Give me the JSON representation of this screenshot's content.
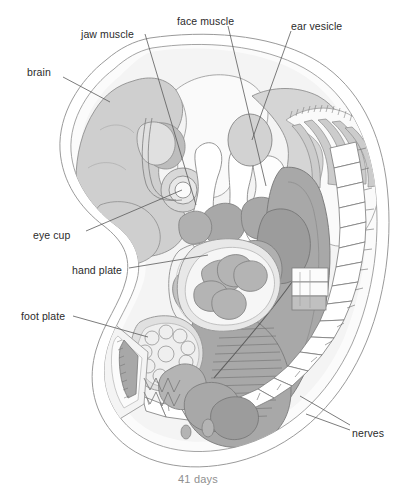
{
  "figure": {
    "caption": "41 days",
    "background_color": "#ffffff",
    "outline_color": "#9a9a9a",
    "line_color": "#6d6d6d",
    "label_color": "#2b2b2b",
    "caption_color": "#8f8f8f",
    "fills": {
      "amnion": "#ffffff",
      "body_pale": "#f2f2f2",
      "tissue_light": "#e2e2e2",
      "tissue_mid": "#cfcfcf",
      "tissue_dark": "#b4b4b4",
      "organ_dark": "#a8a8a8",
      "organ_darkest": "#9c9c9c"
    }
  },
  "labels": [
    {
      "id": "brain",
      "text": "brain",
      "x": 27,
      "y": 66,
      "leader": "M 63,77 L 110,102"
    },
    {
      "id": "jaw-muscle",
      "text": "jaw muscle",
      "x": 81,
      "y": 28,
      "leader": "M 145,34 L 196,205"
    },
    {
      "id": "face-muscle",
      "text": "face muscle",
      "x": 177,
      "y": 15,
      "leader": "M 228,26 L 266,186"
    },
    {
      "id": "ear-vesicle",
      "text": "ear vesicle",
      "x": 291,
      "y": 20,
      "leader": "M 291,31 L 252,140"
    },
    {
      "id": "eye-cup",
      "text": "eye cup",
      "x": 33,
      "y": 229,
      "leader": "M 86,231 L 182,190"
    },
    {
      "id": "hand-plate",
      "text": "hand plate",
      "x": 72,
      "y": 264,
      "leader": "M 129,268 L 208,255"
    },
    {
      "id": "foot-plate",
      "text": "foot plate",
      "x": 21,
      "y": 310,
      "leader": "M 73,316 L 148,337"
    },
    {
      "id": "nerves",
      "text": "nerves",
      "x": 352,
      "y": 427,
      "leader": "M 350,425 L 300,396 M 350,430 L 306,414"
    }
  ],
  "caption": {
    "text": "41 days",
    "x": 178,
    "y": 473
  }
}
